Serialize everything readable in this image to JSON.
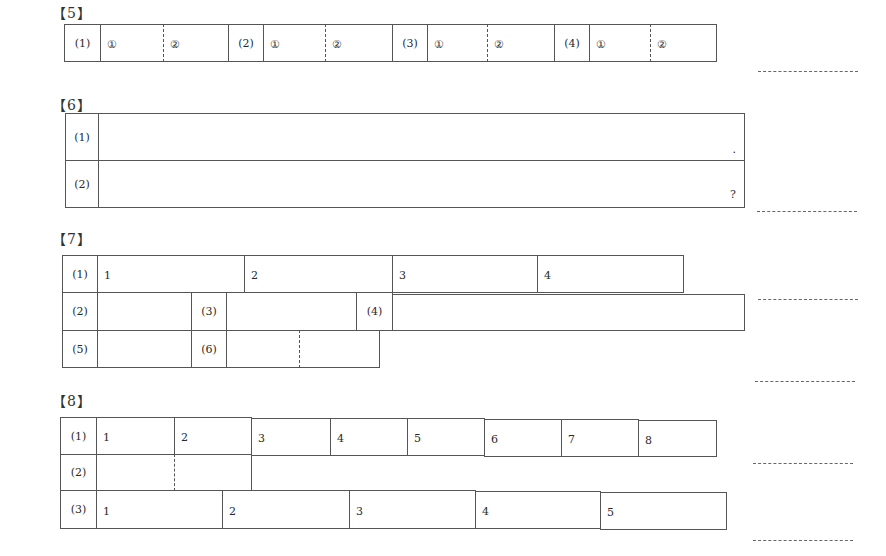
{
  "sections": {
    "s5": {
      "heading": "【5】",
      "groups": [
        {
          "label": "(1)",
          "sub1": "①",
          "sub2": "②"
        },
        {
          "label": "(2)",
          "sub1": "①",
          "sub2": "②"
        },
        {
          "label": "(3)",
          "sub1": "①",
          "sub2": "②"
        },
        {
          "label": "(4)",
          "sub1": "①",
          "sub2": "②"
        }
      ]
    },
    "s6": {
      "heading": "【6】",
      "rows": [
        {
          "label": "(1)",
          "end_mark": "."
        },
        {
          "label": "(2)",
          "end_mark": "?"
        }
      ]
    },
    "s7": {
      "heading": "【7】",
      "row1": {
        "label": "(1)",
        "cells": [
          "1",
          "2",
          "3",
          "4"
        ]
      },
      "row2": {
        "label": "(2)",
        "label3": "(3)",
        "label4": "(4)"
      },
      "row3": {
        "label": "(5)",
        "label6": "(6)"
      }
    },
    "s8": {
      "heading": "【8】",
      "row1": {
        "label": "(1)",
        "cells": [
          "1",
          "2",
          "3",
          "4",
          "5",
          "6",
          "7",
          "8"
        ]
      },
      "row2": {
        "label": "(2)"
      },
      "row3": {
        "label": "(3)",
        "cells": [
          "1",
          "2",
          "3",
          "4",
          "5"
        ]
      }
    }
  }
}
